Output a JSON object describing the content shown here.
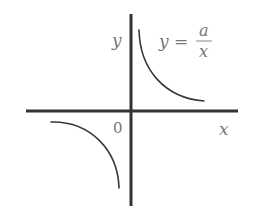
{
  "diagram": {
    "formula": {
      "lhs": "y",
      "equals": "=",
      "numerator": "a",
      "denominator": "x",
      "full_text": "y = a/x"
    },
    "axes": {
      "x_label": "x",
      "y_label": "y",
      "origin_label": "0"
    },
    "branches": [
      {
        "name": "first-quadrant-branch",
        "quadrant": "I"
      },
      {
        "name": "third-quadrant-branch",
        "quadrant": "III"
      }
    ],
    "colors": {
      "axis": "#333333",
      "curve": "#3a3a3a",
      "label": "#777777",
      "background": "#ffffff"
    }
  }
}
